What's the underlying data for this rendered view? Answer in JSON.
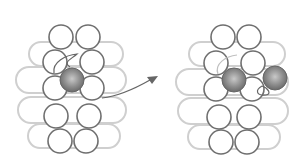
{
  "diagram": {
    "type": "beadwork-stitch-step",
    "panels": [
      {
        "id": "before",
        "description": "Bead column with one shaded bead added in center, thread loop above"
      },
      {
        "id": "after",
        "description": "Second shaded bead added to the right, thread passing through"
      }
    ],
    "arrow": {
      "from": "before",
      "to": "after"
    },
    "colors": {
      "bead_outline": "#6f6f6f",
      "background_loop": "#c8c8c8",
      "shaded_bead": "#8a8a8a",
      "thread": "#6a6a6a"
    }
  }
}
